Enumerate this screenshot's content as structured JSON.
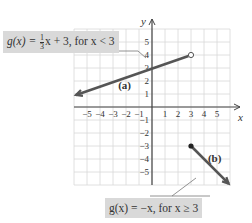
{
  "chart_data": {
    "type": "line",
    "title": "",
    "xlabel": "x",
    "ylabel": "y",
    "xlim": [
      -6,
      6
    ],
    "ylim": [
      -6,
      6
    ],
    "grid": true,
    "x_ticks": [
      -5,
      -4,
      -3,
      -2,
      -1,
      1,
      2,
      3,
      4,
      5
    ],
    "y_ticks": [
      -5,
      -4,
      -3,
      -2,
      -1,
      1,
      2,
      3,
      4,
      5
    ],
    "x_tick_labels": [
      "−5",
      "−4",
      "−3",
      "−2",
      "−1",
      "1",
      "2",
      "3",
      "4",
      "5"
    ],
    "y_tick_labels": [
      "−5",
      "−4",
      "−3",
      "−2",
      "−1",
      "1",
      "2",
      "3",
      "4",
      "5"
    ],
    "series": [
      {
        "name": "(a)",
        "equation": "g(x) = (1/3)x + 3, for x < 3",
        "x": [
          -6,
          3
        ],
        "y": [
          1,
          4
        ],
        "start": "arrow",
        "end": "open-circle",
        "end_point": [
          3,
          4
        ]
      },
      {
        "name": "(b)",
        "equation": "g(x) = −x, for x ≥ 3",
        "x": [
          3,
          6
        ],
        "y": [
          -3,
          -6
        ],
        "start": "closed-dot",
        "start_point": [
          3,
          -3
        ],
        "end": "arrow"
      }
    ],
    "annotations": [
      {
        "text": "(a)",
        "x": -2.3,
        "y": 1.6
      },
      {
        "text": "(b)",
        "x": 4.5,
        "y": -4.1
      }
    ]
  },
  "labels": {
    "a": {
      "lhs": "g(x) =",
      "frac_num": "1",
      "frac_den": "3",
      "rest": "x + 3, for x < 3"
    },
    "b": {
      "text": "g(x) = −x, for x ≥ 3"
    },
    "series_a_tag": "(a)",
    "series_b_tag": "(b)",
    "x_axis_label": "x",
    "y_axis_label": "y"
  },
  "colors": {
    "grid": "#d8d8d8",
    "axis": "#444444",
    "line": "#555555",
    "label_bg": "#d9d9d9",
    "text": "#333333"
  }
}
